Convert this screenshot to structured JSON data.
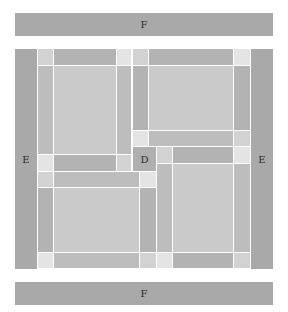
{
  "labels": {
    "top_frame": "F",
    "bottom_frame": "F",
    "left_frame": "E",
    "right_frame": "E",
    "center": "D"
  },
  "colors": {
    "frame": "#a9a9a9",
    "bar": "#b3b3b3",
    "side": "#bdbdbd",
    "center_panel": "#cacaca",
    "corner_light": "#d2d2d2",
    "corner_lightest": "#e4e4e4",
    "background": "#ffffff"
  }
}
